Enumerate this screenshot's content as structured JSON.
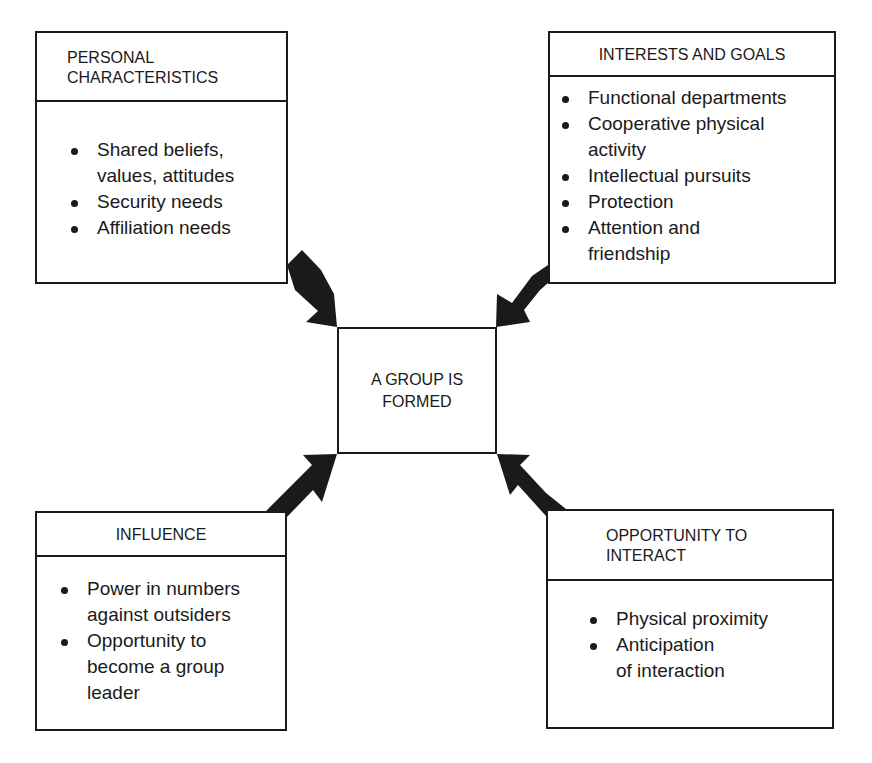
{
  "diagram": {
    "center": {
      "line1": "A GROUP IS",
      "line2": "FORMED"
    },
    "boxes": {
      "personal": {
        "title_line1": "PERSONAL",
        "title_line2": "CHARACTERISTICS",
        "items": [
          "Shared beliefs,",
          "values, attitudes",
          "Security needs",
          "Affiliation needs"
        ]
      },
      "interests": {
        "title": "INTERESTS AND GOALS",
        "items": [
          "Functional departments",
          "Cooperative physical",
          "activity",
          "Intellectual pursuits",
          "Protection",
          "Attention and",
          "friendship"
        ]
      },
      "influence": {
        "title": "INFLUENCE",
        "items": [
          "Power in numbers",
          "against outsiders",
          "Opportunity to",
          "become a group",
          "leader"
        ]
      },
      "opportunity": {
        "title_line1": "OPPORTUNITY TO",
        "title_line2": "INTERACT",
        "items": [
          "Physical proximity",
          "Anticipation",
          "of interaction"
        ]
      }
    },
    "colors": {
      "ink": "#1a1a1a",
      "background": "#ffffff"
    }
  }
}
